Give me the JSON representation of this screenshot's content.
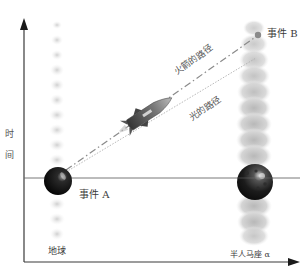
{
  "diagram": {
    "type": "spacetime-diagram",
    "axes": {
      "y_label_chars": [
        "时",
        "间"
      ],
      "y_label": "时间",
      "x_axis_arrow": "right",
      "y_axis_arrow": "up"
    },
    "worldlines": [
      {
        "id": "earth",
        "label": "地球"
      },
      {
        "id": "alpha-centauri",
        "label": "半人马座 α"
      }
    ],
    "events": [
      {
        "id": "A",
        "label": "事件 A"
      },
      {
        "id": "B",
        "label": "事件 B"
      }
    ],
    "paths": [
      {
        "id": "rocket",
        "label": "火箭的路径",
        "style": "dash-dot"
      },
      {
        "id": "light",
        "label": "光的路径",
        "style": "dotted"
      }
    ],
    "colors": {
      "axis": "#3a3a3a",
      "sphere_dark": "#111111",
      "event_b_dot": "#8a8a8a",
      "worldline_earth": "#d6d6d6",
      "worldline_alpha": "#c4c4c4",
      "rocket_path": "#9a9a9a",
      "light_path": "#b5b5b5"
    }
  }
}
